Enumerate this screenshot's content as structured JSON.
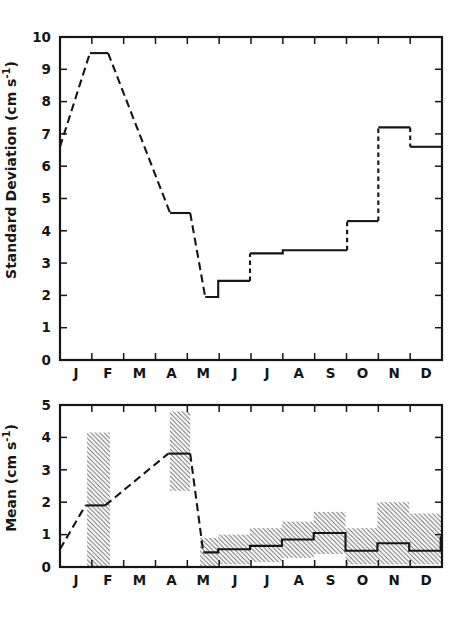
{
  "chart_data": [
    {
      "type": "line",
      "panel": "standard-deviation",
      "title": "",
      "ylabel": {
        "prefix": "Standard Deviation (cm s",
        "sup": "-1",
        "suffix": ")"
      },
      "ylim": [
        0,
        10
      ],
      "yticks": [
        0,
        1,
        2,
        3,
        4,
        5,
        6,
        7,
        8,
        9,
        10
      ],
      "months": [
        "J",
        "F",
        "M",
        "A",
        "M",
        "J",
        "J",
        "A",
        "S",
        "O",
        "N",
        "D"
      ],
      "x_unit_range": [
        0,
        12
      ],
      "line_color": "#161616",
      "grid": "off",
      "start_value": 6.6,
      "plateaus": [
        {
          "month": "Feb",
          "value": 9.5
        },
        {
          "month": "Apr",
          "value": 4.55
        },
        {
          "month": "May",
          "value": 1.95
        },
        {
          "month": "Jun",
          "value": 2.45
        },
        {
          "month": "Jul",
          "value": 3.3
        },
        {
          "month": "Aug-Sep",
          "value": 3.4
        },
        {
          "month": "Oct",
          "value": 4.3
        },
        {
          "month": "Nov",
          "value": 7.2
        },
        {
          "month": "Dec",
          "value": 6.6
        }
      ],
      "segments": [
        {
          "style": "dashed",
          "points": [
            [
              0,
              6.6
            ],
            [
              0.94,
              9.5
            ]
          ]
        },
        {
          "style": "solid",
          "points": [
            [
              0.94,
              9.5
            ],
            [
              1.51,
              9.5
            ]
          ]
        },
        {
          "style": "dashed",
          "points": [
            [
              1.51,
              9.5
            ],
            [
              3.46,
              4.55
            ]
          ]
        },
        {
          "style": "solid",
          "points": [
            [
              3.46,
              4.55
            ],
            [
              4.09,
              4.55
            ]
          ]
        },
        {
          "style": "dashed",
          "points": [
            [
              4.09,
              4.55
            ],
            [
              4.56,
              1.95
            ]
          ]
        },
        {
          "style": "solid",
          "points": [
            [
              4.56,
              1.95
            ],
            [
              4.97,
              1.95
            ],
            [
              4.97,
              2.45
            ],
            [
              5.97,
              2.45
            ]
          ]
        },
        {
          "style": "dashed-short",
          "points": [
            [
              5.97,
              2.45
            ],
            [
              5.97,
              3.3
            ]
          ]
        },
        {
          "style": "solid",
          "points": [
            [
              5.97,
              3.3
            ],
            [
              7.0,
              3.3
            ],
            [
              7.0,
              3.4
            ],
            [
              9.02,
              3.4
            ]
          ]
        },
        {
          "style": "dashed-short",
          "points": [
            [
              9.02,
              3.4
            ],
            [
              9.02,
              4.3
            ]
          ]
        },
        {
          "style": "solid",
          "points": [
            [
              9.02,
              4.3
            ],
            [
              10.0,
              4.3
            ]
          ]
        },
        {
          "style": "dashed-short",
          "points": [
            [
              10.0,
              4.3
            ],
            [
              10.0,
              7.2
            ]
          ]
        },
        {
          "style": "solid",
          "points": [
            [
              10.0,
              7.2
            ],
            [
              11.0,
              7.2
            ]
          ]
        },
        {
          "style": "dashed-short",
          "points": [
            [
              11.0,
              7.2
            ],
            [
              11.0,
              6.6
            ]
          ]
        },
        {
          "style": "solid",
          "points": [
            [
              11.0,
              6.6
            ],
            [
              12,
              6.6
            ]
          ]
        }
      ]
    },
    {
      "type": "line",
      "panel": "mean",
      "title": "",
      "ylabel": {
        "prefix": "Mean (cm s",
        "sup": "-1",
        "suffix": ")"
      },
      "ylim": [
        0,
        5
      ],
      "yticks": [
        0,
        1,
        2,
        3,
        4,
        5
      ],
      "months": [
        "J",
        "F",
        "M",
        "A",
        "M",
        "J",
        "J",
        "A",
        "S",
        "O",
        "N",
        "D"
      ],
      "x_unit_range": [
        0,
        12
      ],
      "line_color": "#161616",
      "hatch_color": "#6e6e6e",
      "grid": "off",
      "start_value": 0.55,
      "plateaus": [
        {
          "month": "Feb",
          "value": 1.9
        },
        {
          "month": "Apr",
          "value": 3.5
        },
        {
          "month": "May",
          "value": 0.45
        },
        {
          "month": "Jun",
          "value": 0.55
        },
        {
          "month": "Jul",
          "value": 0.65
        },
        {
          "month": "Aug",
          "value": 0.85
        },
        {
          "month": "Sep",
          "value": 1.05
        },
        {
          "month": "Oct",
          "value": 0.5
        },
        {
          "month": "Nov",
          "value": 0.73
        },
        {
          "month": "Dec",
          "value": 0.5
        }
      ],
      "segments": [
        {
          "style": "dashed",
          "points": [
            [
              0,
              0.55
            ],
            [
              0.8,
              1.9
            ]
          ]
        },
        {
          "style": "solid",
          "points": [
            [
              0.8,
              1.9
            ],
            [
              1.42,
              1.9
            ]
          ]
        },
        {
          "style": "dashed",
          "points": [
            [
              1.42,
              1.9
            ],
            [
              3.4,
              3.5
            ]
          ]
        },
        {
          "style": "solid",
          "points": [
            [
              3.4,
              3.5
            ],
            [
              4.09,
              3.5
            ]
          ]
        },
        {
          "style": "dashed",
          "points": [
            [
              4.09,
              3.5
            ],
            [
              4.5,
              0.45
            ]
          ]
        },
        {
          "style": "solid",
          "points": [
            [
              4.5,
              0.45
            ],
            [
              4.97,
              0.45
            ],
            [
              4.97,
              0.55
            ],
            [
              5.97,
              0.55
            ],
            [
              5.97,
              0.65
            ],
            [
              6.97,
              0.65
            ],
            [
              6.97,
              0.85
            ],
            [
              7.97,
              0.85
            ],
            [
              7.97,
              1.05
            ],
            [
              8.97,
              1.05
            ],
            [
              8.97,
              0.5
            ],
            [
              9.97,
              0.5
            ],
            [
              9.97,
              0.73
            ],
            [
              10.97,
              0.73
            ],
            [
              10.97,
              0.5
            ],
            [
              11.96,
              0.5
            ],
            [
              11.96,
              0.95
            ]
          ]
        }
      ],
      "uncertainty_bands": [
        {
          "name": "feb-band",
          "rects": [
            [
              0.85,
              1.57,
              0,
              4.15
            ]
          ]
        },
        {
          "name": "apr-band",
          "rects": [
            [
              3.45,
              4.09,
              2.35,
              4.8
            ]
          ]
        },
        {
          "name": "may-dec-band",
          "rects": [
            [
              4.4,
              4.97,
              0,
              0.9
            ],
            [
              4.97,
              5.97,
              0.08,
              1.0
            ],
            [
              5.97,
              6.97,
              0.15,
              1.2
            ],
            [
              6.97,
              7.97,
              0.28,
              1.4
            ],
            [
              7.97,
              8.97,
              0.4,
              1.7
            ],
            [
              8.97,
              9.97,
              0.08,
              1.2
            ],
            [
              9.97,
              10.97,
              0.08,
              2.0
            ],
            [
              10.97,
              12,
              0.08,
              1.65
            ]
          ]
        }
      ]
    }
  ]
}
